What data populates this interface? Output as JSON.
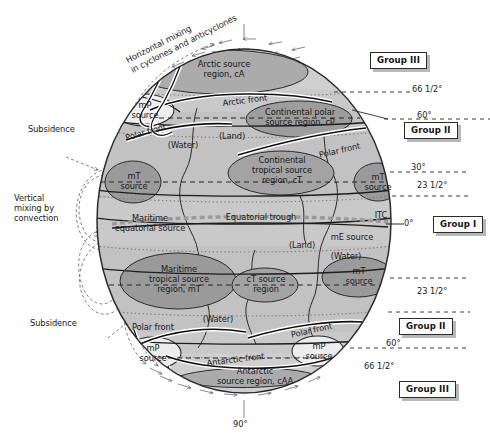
{
  "diagram": {
    "type": "schematic-globe",
    "colors": {
      "ocean_base": "#c9c9c9",
      "mid_band": "#b9b9b9",
      "source_region_dark": "#9a9a9a",
      "source_region_light": "#e4e4e4",
      "outline": "#2b2b2b",
      "front_line": "#111111",
      "dashed_latitude": "#333333",
      "arrow": "#6a6a80",
      "group_box_border": "#2b2b2b",
      "group_box_shadow": "#b8b8b8"
    }
  },
  "external_labels": {
    "horizontal_mixing": "Horizontal mixing\nin cyclones and anticyclones",
    "subsidence_top": "Subsidence",
    "vertical_mixing": "Vertical\nmixing by\nconvection",
    "subsidence_bottom": "Subsidence"
  },
  "source_regions": [
    {
      "id": "arctic",
      "label": "Arctic source\nregion, cA"
    },
    {
      "id": "continental-polar",
      "label": "Continental polar\nsource region, cP"
    },
    {
      "id": "mp-source-nw",
      "label": "mP\nsource"
    },
    {
      "id": "mt-source-nw",
      "label": "mT\nsource"
    },
    {
      "id": "continental-tropical",
      "label": "Continental\ntropical source\nregion, cT"
    },
    {
      "id": "mt-source-ne",
      "label": "mT\nsource"
    },
    {
      "id": "maritime-equatorial",
      "label": "Maritime\nequatorial source"
    },
    {
      "id": "me-source",
      "label": "mE source"
    },
    {
      "id": "maritime-tropical-sw",
      "label": "Maritime\ntropical source\nregion, mT"
    },
    {
      "id": "ct-source",
      "label": "cT source\nregion"
    },
    {
      "id": "mt-source-se",
      "label": "mT\nsource"
    },
    {
      "id": "mp-source-sw",
      "label": "mP\nsource"
    },
    {
      "id": "mp-source-se",
      "label": "mP\nsource"
    },
    {
      "id": "antarctic",
      "label": "Antarctic\nsource region, cAA"
    }
  ],
  "surface_type_labels": [
    {
      "id": "water-nw",
      "label": "(Water)"
    },
    {
      "id": "land-n",
      "label": "(Land)"
    },
    {
      "id": "land-s",
      "label": "(Land)"
    },
    {
      "id": "water-se",
      "label": "(Water)"
    },
    {
      "id": "water-sw",
      "label": "(Water)"
    }
  ],
  "fronts": [
    {
      "id": "arctic-front",
      "label": "Arctic front"
    },
    {
      "id": "polar-front-nw",
      "label": "Polar front"
    },
    {
      "id": "polar-front-ne",
      "label": "Polar front"
    },
    {
      "id": "equatorial-trough",
      "label": "Equatorial trough"
    },
    {
      "id": "itc",
      "label": "ITC"
    },
    {
      "id": "polar-front-sw",
      "label": "Polar front"
    },
    {
      "id": "polar-front-se",
      "label": "Polar front"
    },
    {
      "id": "antarctic-front",
      "label": "Antarctic front"
    }
  ],
  "latitudes": [
    {
      "id": "lat-66n",
      "value": "66",
      "frac": "1/2",
      "unit": "°",
      "text": "66 1/2°"
    },
    {
      "id": "lat-60n",
      "value": "60",
      "frac": "",
      "unit": "°",
      "text": "60°"
    },
    {
      "id": "lat-30n",
      "value": "30",
      "frac": "",
      "unit": "°",
      "text": "30°"
    },
    {
      "id": "lat-23n",
      "value": "23",
      "frac": "1/2",
      "unit": "°",
      "text": "23 1/2°"
    },
    {
      "id": "lat-0",
      "value": "0",
      "frac": "",
      "unit": "°",
      "text": "0°"
    },
    {
      "id": "lat-23s",
      "value": "23",
      "frac": "1/2",
      "unit": "°",
      "text": "23 1/2°"
    },
    {
      "id": "lat-60s",
      "value": "60",
      "frac": "",
      "unit": "°",
      "text": "60°"
    },
    {
      "id": "lat-66s",
      "value": "66",
      "frac": "1/2",
      "unit": "°",
      "text": "66 1/2°"
    },
    {
      "id": "lat-90s",
      "value": "90",
      "frac": "",
      "unit": "°",
      "text": "90°"
    }
  ],
  "groups": [
    {
      "id": "group-3-north",
      "label": "Group III"
    },
    {
      "id": "group-2-north",
      "label": "Group II"
    },
    {
      "id": "group-1",
      "label": "Group I"
    },
    {
      "id": "group-2-south",
      "label": "Group II"
    },
    {
      "id": "group-3-south",
      "label": "Group III"
    }
  ]
}
